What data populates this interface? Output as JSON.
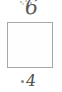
{
  "document": {
    "type": "scanned-form-fragment",
    "width_px": 62,
    "height_px": 92,
    "background_color": "#ffffff"
  },
  "annotations": {
    "top_mark": {
      "name": "handwritten-mark-top",
      "text": "6",
      "description": "faint handwritten ink mark, clipped by the top edge of the crop",
      "color": "#5a5a5a"
    },
    "bottom_mark": {
      "name": "handwritten-digit-bottom",
      "text": "4",
      "description": "handwritten digit four with a small ink tick to its left",
      "color": "#4e4e4e"
    }
  },
  "field": {
    "name": "empty-square-box",
    "value": "",
    "border_color": "#a8a8a8",
    "fill_color": "#fefefe"
  }
}
